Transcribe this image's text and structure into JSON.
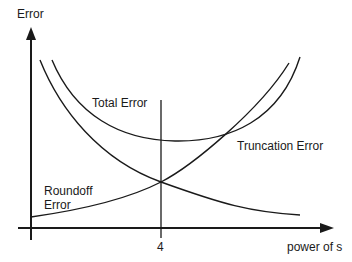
{
  "diagram": {
    "y_axis_label": "Error",
    "x_axis_label": "power of s",
    "tick_label": "4",
    "curves": {
      "total": "Total Error",
      "truncation": "Truncation Error",
      "roundoff_line1": "Roundoff",
      "roundoff_line2": "Error"
    },
    "colors": {
      "stroke": "#1a1a1a",
      "background": "#ffffff"
    }
  }
}
